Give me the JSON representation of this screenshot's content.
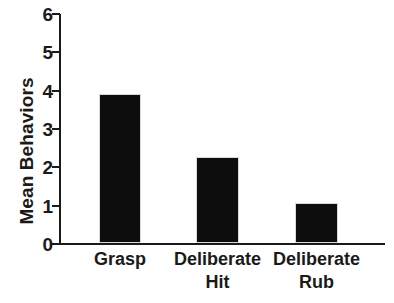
{
  "chart_data": {
    "type": "bar",
    "title": "",
    "xlabel": "",
    "ylabel": "Mean Behaviors",
    "categories": [
      "Grasp",
      "Deliberate Hit",
      "Deliberate Rub"
    ],
    "category_lines": [
      [
        "Grasp"
      ],
      [
        "Deliberate",
        "Hit"
      ],
      [
        "Deliberate",
        "Rub"
      ]
    ],
    "values": [
      3.9,
      2.25,
      1.05
    ],
    "ylim": [
      0,
      6
    ],
    "yticks": [
      0,
      1,
      2,
      3,
      4,
      5,
      6
    ],
    "ytick_labels": [
      "0",
      "1",
      "2",
      "3",
      "4",
      "5",
      "6"
    ],
    "grid": false,
    "legend": null,
    "bar_color": "#0d0d0d",
    "axis_color": "#1a1a1a",
    "background_color": "#ffffff"
  },
  "axis": {
    "y_title": "Mean Behaviors"
  }
}
